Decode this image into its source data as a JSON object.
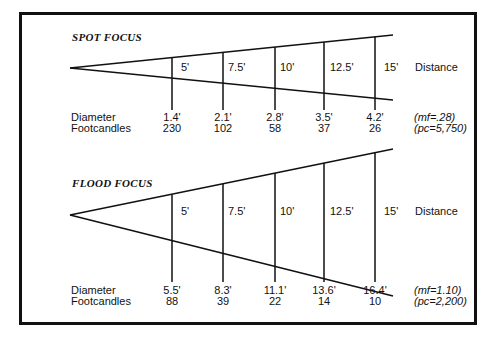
{
  "diagrams": [
    {
      "title": "SPOT FOCUS",
      "distance_label": "Distance",
      "distances": [
        "5'",
        "7.5'",
        "10'",
        "12.5'",
        "15'"
      ],
      "row_labels": {
        "diameter": "Diameter",
        "footcandles": "Footcandles"
      },
      "diameters": [
        "1.4'",
        "2.1'",
        "2.8'",
        "3.5'",
        "4.2'"
      ],
      "footcandles": [
        "230",
        "102",
        "58",
        "37",
        "26"
      ],
      "notes": [
        "(mf=.28)",
        "(pc=5,750)"
      ]
    },
    {
      "title": "FLOOD FOCUS",
      "distance_label": "Distance",
      "distances": [
        "5'",
        "7.5'",
        "10'",
        "12.5'",
        "15'"
      ],
      "row_labels": {
        "diameter": "Diameter",
        "footcandles": "Footcandles"
      },
      "diameters": [
        "5.5'",
        "8.3'",
        "11.1'",
        "13.6'",
        "16.4'"
      ],
      "footcandles": [
        "88",
        "39",
        "22",
        "14",
        "10"
      ],
      "notes": [
        "(mf=1.10)",
        "(pc=2,200)"
      ]
    }
  ]
}
